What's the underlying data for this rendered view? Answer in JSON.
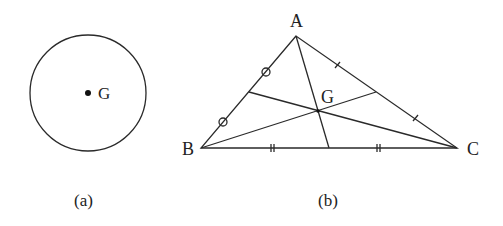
{
  "figure_a": {
    "caption": "(a)",
    "circle": {
      "cx": 88,
      "cy": 93,
      "r": 58
    },
    "point": {
      "x": 88,
      "y": 93,
      "label": "G"
    }
  },
  "figure_b": {
    "caption": "(b)",
    "vertices": {
      "A": {
        "x": 296,
        "y": 36,
        "label": "A"
      },
      "B": {
        "x": 201,
        "y": 148,
        "label": "B"
      },
      "C": {
        "x": 457,
        "y": 148,
        "label": "C"
      }
    },
    "centroid": {
      "x": 318,
      "y": 111,
      "label": "G"
    },
    "midpoints": {
      "AB": {
        "x": 249,
        "y": 92
      },
      "BC": {
        "x": 329,
        "y": 148
      },
      "AC": {
        "x": 376,
        "y": 92
      }
    },
    "tick_marks": {
      "AB": "circle",
      "BC": "double-tick",
      "AC": "single-tick"
    }
  },
  "colors": {
    "line": "#2a2a2a",
    "background": "#ffffff"
  }
}
